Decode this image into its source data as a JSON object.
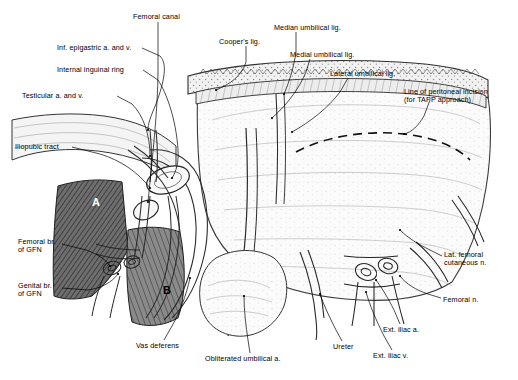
{
  "figure": {
    "background_color": "#ffffff",
    "ink_color": "#1a1a1a"
  },
  "labels": [
    {
      "id": "femoral-canal",
      "text": "Femoral canal",
      "x": 133,
      "y": 13,
      "align": "left"
    },
    {
      "id": "coopers-lig",
      "text": "Cooper's lig.",
      "x": 219,
      "y": 38,
      "align": "left"
    },
    {
      "id": "median-umbilical-lig",
      "text": "Median umbilical lig.",
      "x": 274,
      "y": 24,
      "align": "left"
    },
    {
      "id": "inf-epigastric",
      "text": "Inf. epigastric a. and v.",
      "x": 57,
      "y": 44,
      "align": "left"
    },
    {
      "id": "medial-umbilical-lig",
      "text": "Medial umbilical lig.",
      "x": 290,
      "y": 51,
      "align": "left"
    },
    {
      "id": "internal-inguinal-ring",
      "text": "Internal inguinal ring",
      "x": 57,
      "y": 66,
      "align": "left"
    },
    {
      "id": "lateral-umbilical-lig",
      "text": "Lateral umbilical lig.",
      "x": 330,
      "y": 70,
      "align": "left"
    },
    {
      "id": "testicular-a-v",
      "text": "Testicular a. and v.",
      "x": 22,
      "y": 92,
      "align": "left"
    },
    {
      "id": "line-of-peritoneal-incision",
      "text": "Line of peritoneal incision\n(for TAPP approach)",
      "x": 404,
      "y": 88,
      "align": "left"
    },
    {
      "id": "iliopubic-tract",
      "text": "Iliopubic tract",
      "x": 15,
      "y": 143,
      "align": "left"
    },
    {
      "id": "femoral-br-gfn",
      "text": "Femoral br.\nof GFN",
      "x": 18,
      "y": 238,
      "align": "left"
    },
    {
      "id": "lat-femoral-cutaneous-n",
      "text": "Lat. femoral\ncutaneous n.",
      "x": 444,
      "y": 251,
      "align": "left"
    },
    {
      "id": "genital-br-gfn",
      "text": "Genital br.\nof GFN",
      "x": 18,
      "y": 282,
      "align": "left"
    },
    {
      "id": "femoral-n",
      "text": "Femoral n.",
      "x": 443,
      "y": 296,
      "align": "left"
    },
    {
      "id": "vas-deferens",
      "text": "Vas deferens",
      "x": 136,
      "y": 342,
      "align": "left"
    },
    {
      "id": "obliterated-umbilical-a",
      "text": "Obliterated umbilical a.",
      "x": 205,
      "y": 355,
      "align": "left"
    },
    {
      "id": "ureter",
      "text": "Ureter",
      "x": 333,
      "y": 343,
      "align": "left"
    },
    {
      "id": "ext-iliac-a",
      "text": "Ext. iliac a.",
      "x": 383,
      "y": 326,
      "align": "left"
    },
    {
      "id": "ext-iliac-v",
      "text": "Ext. iliac v.",
      "x": 373,
      "y": 352,
      "align": "left"
    }
  ],
  "region_markers": [
    {
      "id": "region-a",
      "text": "A",
      "x": 92,
      "y": 203
    },
    {
      "id": "region-b",
      "text": "B",
      "x": 163,
      "y": 291
    }
  ]
}
